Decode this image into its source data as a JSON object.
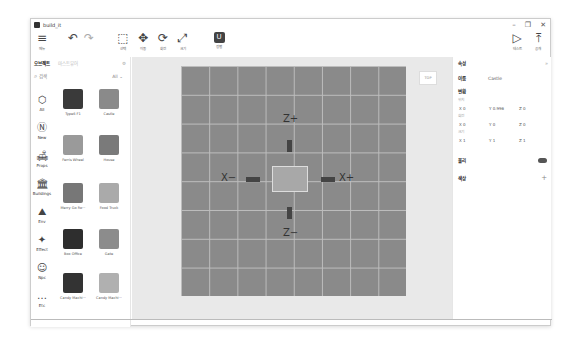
{
  "window": {
    "title": "build_it",
    "controls": [
      "–",
      "❐",
      "✕"
    ]
  },
  "toolbar": {
    "left": [
      {
        "id": "menu",
        "icon": "≡",
        "label": "메뉴"
      },
      {
        "id": "undo",
        "icon": "↶",
        "label": ""
      },
      {
        "id": "redo",
        "icon": "↷",
        "label": ""
      },
      {
        "id": "select",
        "icon": "⬚",
        "label": "선택"
      },
      {
        "id": "move",
        "icon": "✥",
        "label": "이동"
      },
      {
        "id": "rotate",
        "icon": "⟳",
        "label": "회전"
      },
      {
        "id": "scale",
        "icon": "⤢",
        "label": "크기"
      },
      {
        "id": "magnet",
        "icon": "U",
        "label": "정렬"
      }
    ],
    "right": [
      {
        "id": "test",
        "icon": "▷",
        "label": "테스트"
      },
      {
        "id": "publish",
        "icon": "⤒",
        "label": "공개"
      }
    ]
  },
  "left_panel": {
    "tabs": [
      {
        "label": "오브젝트",
        "active": true
      },
      {
        "label": "마스트뷰어",
        "active": false
      }
    ],
    "settings_icon": "⚙",
    "search": {
      "placeholder": "검색",
      "filter": "All"
    },
    "categories": [
      {
        "label": "All",
        "icon": "⬡"
      },
      {
        "label": "New",
        "icon": "Ⓝ"
      },
      {
        "label": "Props",
        "icon": "🛋"
      },
      {
        "label": "Buildings",
        "icon": "🏛"
      },
      {
        "label": "Env",
        "icon": "⛰"
      },
      {
        "label": "Effect",
        "icon": "✦"
      },
      {
        "label": "Npc",
        "icon": "☺"
      },
      {
        "label": "Etc",
        "icon": "…"
      }
    ],
    "items": [
      {
        "label": "Type6 F1",
        "color": "#3a3a3a"
      },
      {
        "label": "Castle",
        "color": "#8a8a8a"
      },
      {
        "label": "Ferris Wheel",
        "color": "#9a9a9a"
      },
      {
        "label": "House",
        "color": "#7a7a7a"
      },
      {
        "label": "Merry Go Ro···",
        "color": "#777"
      },
      {
        "label": "Food Truck",
        "color": "#aaa"
      },
      {
        "label": "Box Office",
        "color": "#2e2e2e"
      },
      {
        "label": "Gate",
        "color": "#8c8c8c"
      },
      {
        "label": "Candy Machi···",
        "color": "#333"
      },
      {
        "label": "Candy Machi···",
        "color": "#b0b0b0"
      }
    ]
  },
  "viewport": {
    "axes": {
      "z_plus": "Z+",
      "z_minus": "Z−",
      "x_plus": "X+",
      "x_minus": "X−"
    },
    "view_cube": "TOP"
  },
  "right_panel": {
    "title": "속성",
    "name_label": "이름",
    "name_value": "Castle",
    "transform_label": "변환",
    "position_label": "위치",
    "position": {
      "x": "X 0",
      "y": "Y 0.996",
      "z": "Z 0"
    },
    "rotation_label": "회전",
    "rotation": {
      "x": "X 0",
      "y": "Y 0",
      "z": "Z 0"
    },
    "scale_label": "크기",
    "scale": {
      "x": "X 1",
      "y": "Y 1",
      "z": "Z 1"
    },
    "physics_label": "물리",
    "physics_on": true,
    "color_label": "색상",
    "add_icon": "+"
  }
}
